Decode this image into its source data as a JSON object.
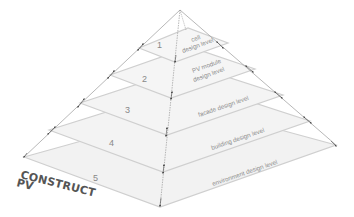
{
  "diagram": {
    "title": "CONSTRUCT PV",
    "brand_line1": "CONSTRUCT",
    "brand_line2": "PV",
    "colors": {
      "plate_fill": "#f1f1f1",
      "plate_edge": "#cfcfcf",
      "edge_line": "#9a9a9a",
      "arrow": "#4a4a4a",
      "text": "#8c8c8c"
    },
    "levels": [
      {
        "number": "1",
        "label_line1": "cell",
        "label_line2": "design level"
      },
      {
        "number": "2",
        "label_line1": "PV module",
        "label_line2": "design level"
      },
      {
        "number": "3",
        "label_line1": "facade design level",
        "label_line2": ""
      },
      {
        "number": "4",
        "label_line1": "building design level",
        "label_line2": ""
      },
      {
        "number": "5",
        "label_line1": "environment design level",
        "label_line2": ""
      }
    ]
  }
}
